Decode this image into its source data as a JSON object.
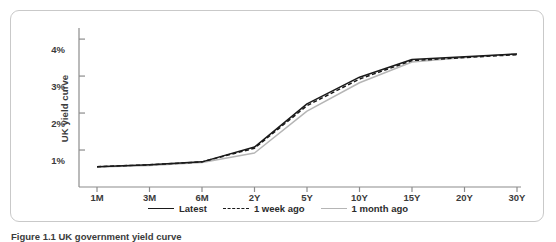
{
  "figure": {
    "caption": "Figure 1.1 UK government yield curve"
  },
  "chart_data": {
    "type": "line",
    "title": "",
    "xlabel": "",
    "ylabel": "UK yield curve",
    "grid": false,
    "legend_position": "bottom-center",
    "x": [
      "1M",
      "3M",
      "6M",
      "2Y",
      "5Y",
      "10Y",
      "15Y",
      "20Y",
      "30Y"
    ],
    "x_tick_labels": [
      "1M",
      "3M",
      "6M",
      "2Y",
      "5Y",
      "10Y",
      "15Y",
      "20Y",
      "30Y"
    ],
    "y_tick_labels": [
      "1%",
      "2%",
      "3%",
      "4%"
    ],
    "y_ticks": [
      1,
      2,
      3,
      4
    ],
    "ylim": [
      0,
      4.3
    ],
    "yunit": "%",
    "series": [
      {
        "name": "Latest",
        "color": "#1a1a1a",
        "style": "solid",
        "values": [
          0.55,
          0.6,
          0.68,
          1.08,
          2.25,
          2.97,
          3.45,
          3.52,
          3.6
        ]
      },
      {
        "name": "1 week ago",
        "color": "#1a1a1a",
        "style": "dashed",
        "values": [
          0.55,
          0.6,
          0.68,
          1.05,
          2.2,
          2.92,
          3.42,
          3.5,
          3.58
        ]
      },
      {
        "name": "1 month ago",
        "color": "#b5b5b5",
        "style": "solid",
        "values": [
          0.54,
          0.58,
          0.66,
          0.92,
          2.05,
          2.82,
          3.38,
          3.5,
          3.6
        ]
      }
    ]
  },
  "legend": {
    "items": [
      {
        "label": "Latest",
        "color": "#1a1a1a",
        "style": "solid"
      },
      {
        "label": "1 week ago",
        "color": "#1a1a1a",
        "style": "dashed"
      },
      {
        "label": "1 month ago",
        "color": "#b5b5b5",
        "style": "solid"
      }
    ]
  },
  "axes": {
    "axis_color": "#8c8c8c"
  }
}
